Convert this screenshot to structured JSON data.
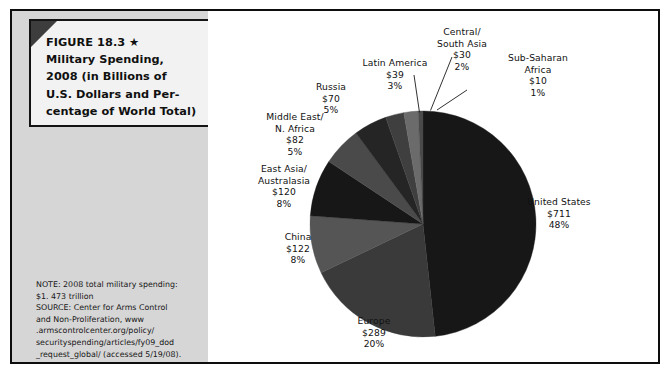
{
  "figure": {
    "title": "FIGURE 18.3 ★\nMilitary Spending,\n2008 (in Billions of\nU.S. Dollars and Per-\ncentage of World Total)",
    "note": "NOTE: 2008 total military spending:\n$1. 473 trillion\nSOURCE: Center for Arms Control\nand Non-Proliferation, www\n.armscontrolcenter.org/policy/\nsecurityspending/articles/fy09_dod\n_request_global/ (accessed 5/19/08)."
  },
  "labels": {
    "united_states": "United States\n$711\n48%",
    "europe": "Europe\n$289\n20%",
    "china": "China\n$122\n8%",
    "east_asia": "East Asia/\nAustralasia\n$120\n8%",
    "middle_east": "Middle East/\nN. Africa\n$82\n5%",
    "russia": "Russia\n$70\n5%",
    "latin_america": "Latin America\n$39\n3%",
    "central_south_asia": "Central/\nSouth Asia\n$30\n2%",
    "sub_saharan": "Sub-Saharan\nAfrica\n$10\n1%"
  },
  "chart_data": {
    "type": "pie",
    "unit": "Billions of U.S. Dollars",
    "total": 1473,
    "total_label": "$1. 473 trillion",
    "legend": "none (direct labels with leader lines)",
    "grid": false,
    "start_angle_deg": 0,
    "direction": "clockwise",
    "categories": [
      "United States",
      "Europe",
      "China",
      "East Asia/Australasia",
      "Middle East/N. Africa",
      "Russia",
      "Latin America",
      "Central/South Asia",
      "Sub-Saharan Africa"
    ],
    "values": [
      711,
      289,
      122,
      120,
      82,
      70,
      39,
      30,
      10
    ],
    "percentages": [
      48,
      20,
      8,
      8,
      5,
      5,
      3,
      2,
      1
    ],
    "slice_colors": [
      "#171717",
      "#3a3a3a",
      "#555555",
      "#171717",
      "#4a4a4a",
      "#252525",
      "#3f3f3f",
      "#6b6b6b",
      "#4a4a4a"
    ],
    "slices": [
      {
        "label": "United States",
        "value": 711,
        "percent": 48,
        "color": "#171717"
      },
      {
        "label": "Europe",
        "value": 289,
        "percent": 20,
        "color": "#3a3a3a"
      },
      {
        "label": "China",
        "value": 122,
        "percent": 8,
        "color": "#555555"
      },
      {
        "label": "East Asia/Australasia",
        "value": 120,
        "percent": 8,
        "color": "#171717"
      },
      {
        "label": "Middle East/N. Africa",
        "value": 82,
        "percent": 5,
        "color": "#4a4a4a"
      },
      {
        "label": "Russia",
        "value": 70,
        "percent": 5,
        "color": "#252525"
      },
      {
        "label": "Latin America",
        "value": 39,
        "percent": 3,
        "color": "#3f3f3f"
      },
      {
        "label": "Central/South Asia",
        "value": 30,
        "percent": 2,
        "color": "#6b6b6b"
      },
      {
        "label": "Sub-Saharan Africa",
        "value": 10,
        "percent": 1,
        "color": "#4a4a4a"
      }
    ]
  }
}
